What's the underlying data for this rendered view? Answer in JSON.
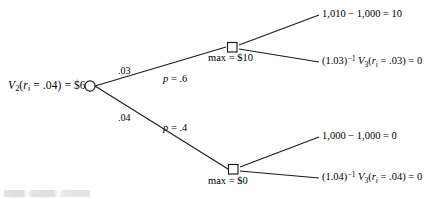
{
  "figure": {
    "type": "binomial-interest-rate-decision-tree",
    "line_color": "#1a1a1a",
    "text_color": "#000000",
    "background": "#ffffff"
  },
  "root": {
    "name": "root-chance-node",
    "shape": "circle",
    "label_prefix": "V",
    "label_subscript": "2",
    "label_arg_open": "(",
    "label_var": "r",
    "label_var_sub": "i",
    "label_rate": " = .04) = $6",
    "label_plain": "V2(ri = .04) = $6"
  },
  "branches": [
    {
      "name": "upper-branch",
      "rate": ".03",
      "probability_label_var": "p",
      "probability_label_rest": " = .6",
      "probability_plain": "p = .6"
    },
    {
      "name": "lower-branch",
      "rate": ".04",
      "probability_label_var": "p",
      "probability_label_rest": " = .4",
      "probability_plain": "p = .4"
    }
  ],
  "decision_nodes": [
    {
      "name": "upper-decision-node",
      "shape": "square",
      "label": "max = $10"
    },
    {
      "name": "lower-decision-node",
      "shape": "square",
      "label": "max = $0"
    }
  ],
  "payoffs": [
    {
      "name": "payoff-exercise-up",
      "parts": {
        "plain": "1,010 − 1,000 = 10"
      }
    },
    {
      "name": "payoff-continue-up",
      "parts": {
        "discount_open": "(1.03)",
        "discount_exp": "−1",
        "value_var": "V",
        "value_sub": "3",
        "arg_open": "(",
        "arg_var": "r",
        "arg_var_sub": "i",
        "arg_rest": " = .03) = 0",
        "plain": "(1.03)−1 V3(ri = .03) = 0"
      }
    },
    {
      "name": "payoff-exercise-down",
      "parts": {
        "plain": "1,000 − 1,000 = 0"
      }
    },
    {
      "name": "payoff-continue-down",
      "parts": {
        "discount_open": "(1.04)",
        "discount_exp": "−1",
        "value_var": "V",
        "value_sub": "3",
        "arg_open": "(",
        "arg_var": "r",
        "arg_var_sub": "i",
        "arg_rest": " = .04) = 0",
        "plain": "(1.04)−1 V3(ri = .04) = 0"
      }
    }
  ]
}
